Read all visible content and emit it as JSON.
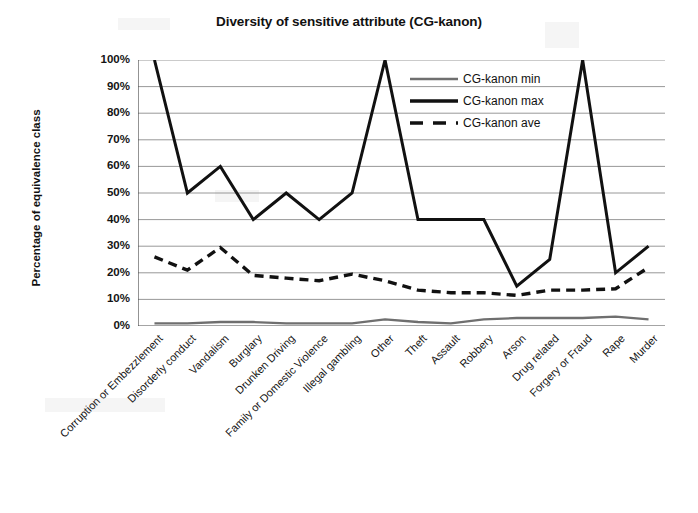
{
  "chart_data": {
    "type": "line",
    "title": "Diversity of sensitive attribute (CG-kanon)",
    "xlabel": "",
    "ylabel": "Percentage of equivalence class",
    "ylim": [
      0,
      100
    ],
    "ytick_labels": [
      "100%",
      "90%",
      "80%",
      "70%",
      "60%",
      "50%",
      "40%",
      "30%",
      "20%",
      "10%",
      "0%"
    ],
    "ytick_values": [
      100,
      90,
      80,
      70,
      60,
      50,
      40,
      30,
      20,
      10,
      0
    ],
    "grid": true,
    "legend_position": "inside-upper-right",
    "categories": [
      "Corruption or Embezzlement",
      "Disorderly conduct",
      "Vandalism",
      "Burglary",
      "Drunken Driving",
      "Family or Domestic Violence",
      "Illegal gambling",
      "Other",
      "Theft",
      "Assault",
      "Robbery",
      "Arson",
      "Drug related",
      "Forgery or Fraud",
      "Rape",
      "Murder"
    ],
    "series": [
      {
        "name": "CG-kanon min",
        "style": "solid-thin",
        "color": "#6f6f6f",
        "values": [
          1,
          1,
          1.5,
          1.5,
          1,
          1,
          1,
          2.5,
          1.5,
          1,
          2.5,
          3,
          3,
          3,
          3.5,
          2.5
        ]
      },
      {
        "name": "CG-kanon max",
        "style": "solid-thick",
        "color": "#111111",
        "values": [
          100,
          50,
          60,
          40,
          50,
          40,
          50,
          100,
          40,
          40,
          40,
          15,
          25,
          100,
          20,
          30
        ]
      },
      {
        "name": "CG-kanon ave",
        "style": "dashed-thick",
        "color": "#111111",
        "values": [
          26,
          21,
          29.5,
          19,
          18,
          17,
          19.5,
          17,
          13.5,
          12.5,
          12.5,
          11.5,
          13.5,
          13.5,
          14,
          22
        ]
      }
    ]
  },
  "legend": {
    "items": [
      {
        "label": "CG-kanon min",
        "style": "solid-thin",
        "color": "#6f6f6f"
      },
      {
        "label": "CG-kanon max",
        "style": "solid-thick",
        "color": "#111111"
      },
      {
        "label": "CG-kanon ave",
        "style": "dashed-thick",
        "color": "#111111"
      }
    ]
  }
}
